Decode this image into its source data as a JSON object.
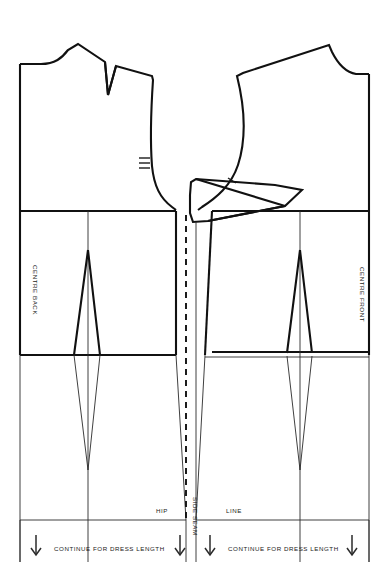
{
  "diagram": {
    "type": "sewing-pattern",
    "background_color": "#ffffff",
    "line_color": "#111111"
  },
  "labels": {
    "centre_back": "CENTRE BACK",
    "centre_front": "CENTRE FRONT",
    "hip": "HIP",
    "line": "LINE",
    "side_seam": "SIDE SEAM",
    "continue_back": "CONTINUE FOR DRESS LENGTH",
    "continue_front": "CONTINUE FOR DRESS LENGTH"
  },
  "pieces": [
    {
      "id": "back-bodice",
      "name": "Back bodice",
      "side": "left",
      "features": [
        "shoulder-dart",
        "armhole-double-notch",
        "neckline"
      ]
    },
    {
      "id": "front-bodice",
      "name": "Front bodice",
      "side": "right",
      "features": [
        "bust-dart",
        "armhole-single-notch",
        "neckline"
      ]
    },
    {
      "id": "back-skirt",
      "name": "Back skirt",
      "side": "left",
      "features": [
        "waist-dart-diamond",
        "hip-line",
        "extension-arrow"
      ]
    },
    {
      "id": "front-skirt",
      "name": "Front skirt",
      "side": "right",
      "features": [
        "waist-dart-diamond",
        "hip-line",
        "extension-arrow"
      ]
    }
  ],
  "geometry": {
    "left_edge_x": 20,
    "right_edge_x": 369,
    "centre_dash_x": 186,
    "side_seam_x": 196,
    "waist_y": 211,
    "hip_y": 355,
    "hipline_label_y": 511,
    "bottom_rule_y": 520,
    "bottom_edge_y": 562,
    "back_dart_x": 88,
    "front_dart_x": 300,
    "dart_top_y": 250,
    "dart_bottom_y": 470
  },
  "arrows": {
    "direction": "down",
    "count": 4,
    "positions_x": [
      36,
      180,
      210,
      352
    ]
  }
}
